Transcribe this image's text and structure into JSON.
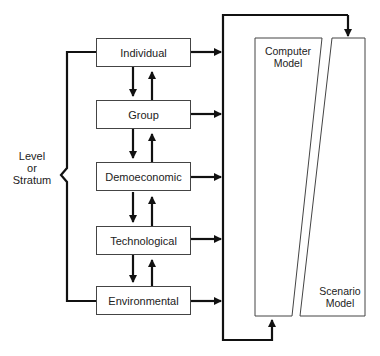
{
  "diagram": {
    "levels": [
      {
        "label": "Individual"
      },
      {
        "label": "Group"
      },
      {
        "label": "Demoeconomic"
      },
      {
        "label": "Technological"
      },
      {
        "label": "Environmental"
      }
    ],
    "side_label": {
      "line1": "Level",
      "line2": "or",
      "line3": "Stratum"
    },
    "models": {
      "computer": {
        "line1": "Computer",
        "line2": "Model"
      },
      "scenario": {
        "line1": "Scenario",
        "line2": "Model"
      }
    },
    "colors": {
      "line": "#111111",
      "box_border": "#444444",
      "background": "#ffffff"
    }
  }
}
